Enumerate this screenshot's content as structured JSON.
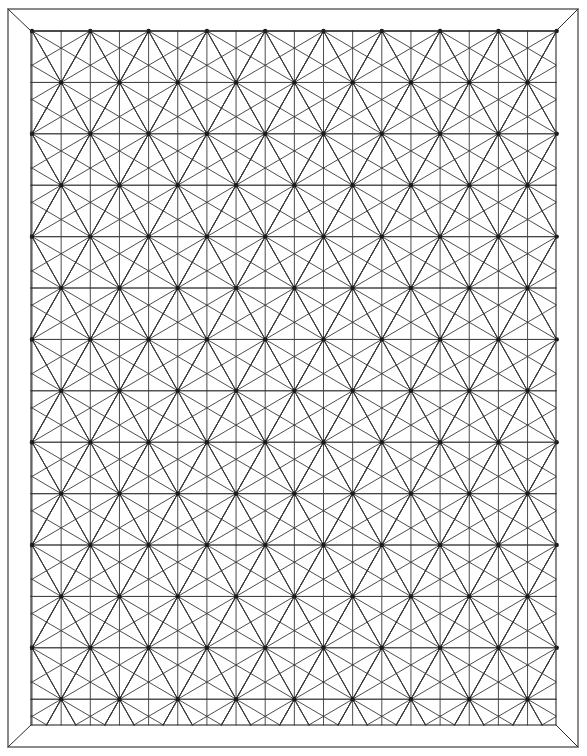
{
  "document": {
    "title": "Asanoha Geometric Pattern Plate",
    "kind": "line-art-pattern",
    "pattern_name": "Asanoha (hemp leaf)",
    "background_color": "#ffffff",
    "canvas": {
      "width": 587,
      "height": 756
    }
  },
  "colors": {
    "line": "#3a3a3a",
    "rail": "#454545",
    "frame": "#2b2b2b",
    "hub": "#1a1a1a",
    "paper": "#ffffff"
  },
  "frame": {
    "outer": {
      "x": 8,
      "y": 9,
      "width": 570,
      "height": 738
    },
    "inner": {
      "x": 31,
      "y": 31,
      "width": 525,
      "height": 694
    },
    "miter_corners": [
      "top-left",
      "top-right",
      "bottom-left",
      "bottom-right"
    ],
    "stroke_width": 1.1
  },
  "pattern": {
    "type": "asanoha",
    "origin_x": 32,
    "origin_y": 31,
    "cell_width": 58.3,
    "row_height": 51.4,
    "columns": 10,
    "rows": 14,
    "spokes_per_hub": 12,
    "hub_radius": 2.2,
    "stagger": "alternate rows offset by half cell",
    "rails": "horizontal lines through every hub row",
    "leaf_outline": "hexagonal lozenge between adjacent hubs"
  }
}
